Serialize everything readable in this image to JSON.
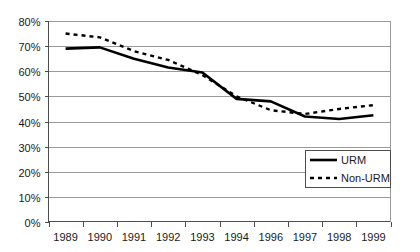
{
  "chart_data": {
    "type": "line",
    "title": "",
    "subtitle": "",
    "xlabel": "",
    "ylabel": "",
    "grid": true,
    "legend_position": "bottom-right",
    "categories": [
      "1989",
      "1990",
      "1991",
      "1992",
      "1993",
      "1994",
      "1996",
      "1997",
      "1998",
      "1999"
    ],
    "ylim": [
      0,
      80
    ],
    "ytick_values": [
      0,
      10,
      20,
      30,
      40,
      50,
      60,
      70,
      80
    ],
    "ytick_labels": [
      "0%",
      "10%",
      "20%",
      "30%",
      "40%",
      "50%",
      "60%",
      "70%",
      "80%"
    ],
    "series": [
      {
        "name": "URM",
        "style": "solid",
        "color": "#000000",
        "values": [
          69,
          69.5,
          65,
          61.5,
          59.5,
          49,
          48,
          42,
          41,
          42.5
        ]
      },
      {
        "name": "Non-URM",
        "style": "dashed",
        "color": "#000000",
        "values": [
          75,
          73.5,
          68,
          64.5,
          58.5,
          50,
          44.5,
          43,
          45,
          46.5
        ]
      }
    ],
    "legend": [
      {
        "label": "URM",
        "style": "solid"
      },
      {
        "label": "Non-URM",
        "style": "dashed"
      }
    ]
  },
  "colors": {
    "gridline": "#9a9a9a",
    "axis": "#4d4d4d",
    "series": "#000000",
    "background": "#ffffff",
    "text": "#1a1a1a"
  }
}
